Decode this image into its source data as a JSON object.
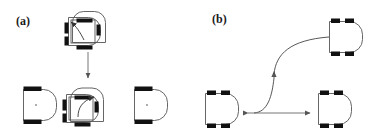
{
  "figure": {
    "width": 376,
    "height": 135,
    "background": "#ffffff",
    "stroke_color": "#3a3a3a",
    "wheel_color": "#111111",
    "arrow_color": "#555555",
    "caption_font_weight": "bold"
  },
  "panels": [
    {
      "id": "a",
      "label": "(a)",
      "description": "in-place rotation primitive"
    },
    {
      "id": "b",
      "label": "(b)",
      "description": "translation primitive"
    }
  ],
  "panel_a": {
    "label": "(a)",
    "robots": [
      {
        "name": "robot-top-center-start",
        "wheels": 2,
        "heading": "right"
      },
      {
        "name": "robot-top-center-rotated",
        "wheels": 0,
        "heading": "down"
      },
      {
        "name": "robot-bottom-left",
        "wheels": 2,
        "heading": "right"
      },
      {
        "name": "robot-bottom-center-start",
        "wheels": 2,
        "heading": "right"
      },
      {
        "name": "robot-bottom-center-rotated",
        "wheels": 0,
        "heading": "up"
      },
      {
        "name": "robot-bottom-right",
        "wheels": 2,
        "heading": "right"
      }
    ],
    "arrows": [
      {
        "name": "rotation-arrow-top",
        "type": "curved",
        "direction": "counter-clockwise"
      },
      {
        "name": "rotation-arrow-bottom",
        "type": "curved",
        "direction": "clockwise"
      },
      {
        "name": "transition-arrow",
        "type": "straight",
        "direction": "down"
      }
    ]
  },
  "panel_b": {
    "label": "(b)",
    "robots": [
      {
        "name": "robot-top-right",
        "wheels": 4,
        "heading": "right"
      },
      {
        "name": "robot-bottom-left",
        "wheels": 4,
        "heading": "right"
      },
      {
        "name": "robot-bottom-right",
        "wheels": 4,
        "heading": "right"
      }
    ],
    "arrows": [
      {
        "name": "s-curve-path-arrow",
        "type": "curved",
        "direction": "up-right"
      },
      {
        "name": "lateral-double-arrow",
        "type": "straight",
        "direction": "bidirectional"
      }
    ]
  }
}
